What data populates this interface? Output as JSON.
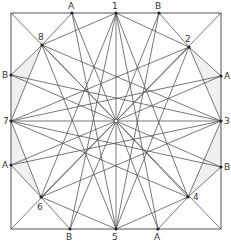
{
  "diagram": {
    "type": "geometric-construction",
    "stroke_color": "#555555",
    "shade_color": "#f0f0f0",
    "square": {
      "x1": 11,
      "y1": 13,
      "x2": 221,
      "y2": 229
    },
    "center": {
      "x": 116,
      "y": 121
    },
    "numbered_points": [
      {
        "id": "1",
        "label": "1",
        "x": 116,
        "y": 13,
        "lx": 112,
        "ly": 2
      },
      {
        "id": "2",
        "label": "2",
        "x": 189,
        "y": 47,
        "lx": 185,
        "ly": 35
      },
      {
        "id": "3",
        "label": "3",
        "x": 221,
        "y": 121,
        "lx": 224,
        "ly": 117
      },
      {
        "id": "4",
        "label": "4",
        "x": 188,
        "y": 197,
        "lx": 193,
        "ly": 193
      },
      {
        "id": "5",
        "label": "5",
        "x": 116,
        "y": 229,
        "lx": 112,
        "ly": 233
      },
      {
        "id": "6",
        "label": "6",
        "x": 41,
        "y": 197,
        "lx": 37,
        "ly": 203
      },
      {
        "id": "7",
        "label": "7",
        "x": 11,
        "y": 121,
        "lx": 3,
        "ly": 117
      },
      {
        "id": "8",
        "label": "8",
        "x": 42,
        "y": 45,
        "lx": 38,
        "ly": 33
      }
    ],
    "edge_points": [
      {
        "id": "A-top",
        "label": "A",
        "x": 72,
        "y": 13,
        "lx": 68,
        "ly": 2
      },
      {
        "id": "B-top",
        "label": "B",
        "x": 159,
        "y": 13,
        "lx": 155,
        "ly": 2
      },
      {
        "id": "A-right",
        "label": "A",
        "x": 221,
        "y": 76,
        "lx": 224,
        "ly": 72
      },
      {
        "id": "B-right",
        "label": "B",
        "x": 221,
        "y": 167,
        "lx": 224,
        "ly": 163
      },
      {
        "id": "A-bottom",
        "label": "A",
        "x": 158,
        "y": 229,
        "lx": 154,
        "ly": 233
      },
      {
        "id": "B-bottom",
        "label": "B",
        "x": 70,
        "y": 229,
        "lx": 66,
        "ly": 233
      },
      {
        "id": "A-left",
        "label": "A",
        "x": 11,
        "y": 165,
        "lx": 2,
        "ly": 161
      },
      {
        "id": "B-left",
        "label": "B",
        "x": 11,
        "y": 75,
        "lx": 2,
        "ly": 71
      }
    ],
    "lines": [
      [
        "C",
        "1"
      ],
      [
        "C",
        "2"
      ],
      [
        "C",
        "3"
      ],
      [
        "C",
        "4"
      ],
      [
        "C",
        "5"
      ],
      [
        "C",
        "6"
      ],
      [
        "C",
        "7"
      ],
      [
        "C",
        "8"
      ],
      [
        "C",
        "TL"
      ],
      [
        "C",
        "TR"
      ],
      [
        "C",
        "BR"
      ],
      [
        "C",
        "BL"
      ],
      [
        "C",
        "A-top"
      ],
      [
        "C",
        "B-top"
      ],
      [
        "C",
        "A-right"
      ],
      [
        "C",
        "B-right"
      ],
      [
        "C",
        "A-bottom"
      ],
      [
        "C",
        "B-bottom"
      ],
      [
        "C",
        "A-left"
      ],
      [
        "C",
        "B-left"
      ],
      [
        "1",
        "4"
      ],
      [
        "1",
        "6"
      ],
      [
        "2",
        "5"
      ],
      [
        "2",
        "7"
      ],
      [
        "3",
        "6"
      ],
      [
        "3",
        "8"
      ],
      [
        "4",
        "7"
      ],
      [
        "5",
        "8"
      ],
      [
        "1",
        "8"
      ],
      [
        "1",
        "2"
      ],
      [
        "2",
        "3"
      ],
      [
        "3",
        "4"
      ],
      [
        "4",
        "5"
      ],
      [
        "5",
        "6"
      ],
      [
        "6",
        "7"
      ],
      [
        "7",
        "8"
      ],
      [
        "8",
        "A-top"
      ],
      [
        "8",
        "B-left"
      ],
      [
        "2",
        "B-top"
      ],
      [
        "2",
        "A-right"
      ],
      [
        "4",
        "B-right"
      ],
      [
        "4",
        "A-bottom"
      ],
      [
        "6",
        "B-bottom"
      ],
      [
        "6",
        "A-left"
      ],
      [
        "A-top",
        "5"
      ],
      [
        "B-top",
        "5"
      ],
      [
        "A-bottom",
        "1"
      ],
      [
        "B-bottom",
        "1"
      ],
      [
        "A-right",
        "7"
      ],
      [
        "B-right",
        "7"
      ],
      [
        "A-left",
        "3"
      ],
      [
        "B-left",
        "3"
      ]
    ]
  }
}
